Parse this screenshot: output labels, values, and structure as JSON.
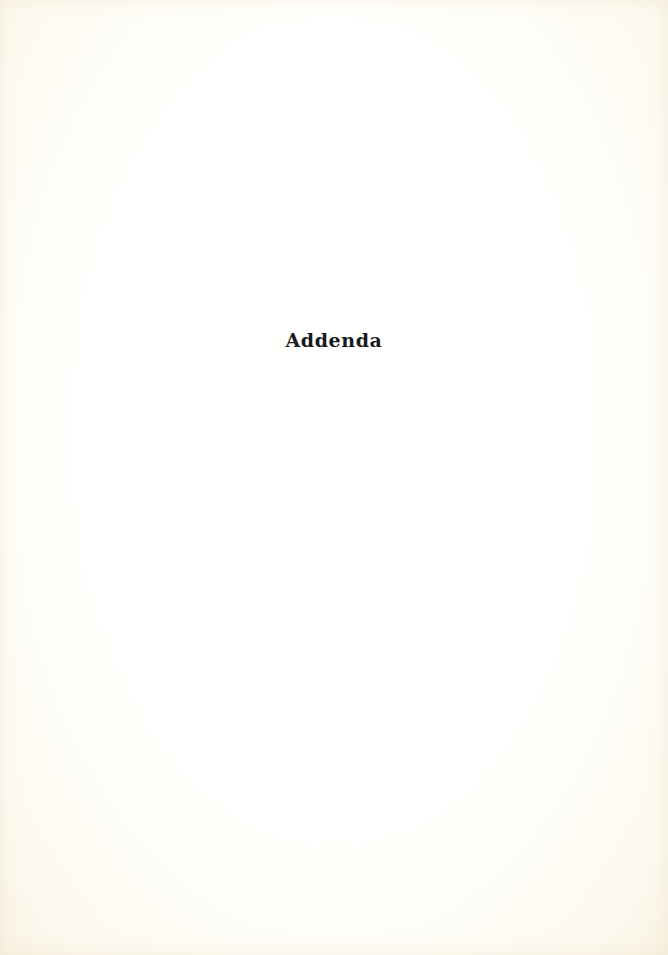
{
  "page": {
    "heading": "Addenda",
    "colors": {
      "paper": "#fefcf6",
      "text": "#1a1a1a"
    }
  }
}
